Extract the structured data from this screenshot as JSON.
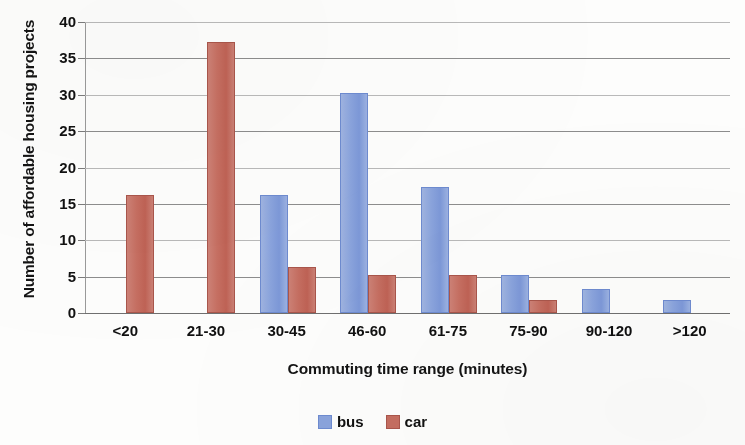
{
  "chart_data": {
    "type": "bar",
    "title": "",
    "xlabel": "Commuting time range (minutes)",
    "ylabel": "Number of affordable housing projects",
    "categories": [
      "<20",
      "21-30",
      "30-45",
      "46-60",
      "61-75",
      "75-90",
      "90-120",
      ">120"
    ],
    "series": [
      {
        "name": "bus",
        "color": "#8aa3dc",
        "values": [
          0,
          0,
          16,
          30,
          17,
          5,
          3,
          1.5
        ]
      },
      {
        "name": "car",
        "color": "#c56e61",
        "values": [
          16,
          37,
          6,
          5,
          5,
          1.5,
          0,
          0
        ]
      }
    ],
    "ylim": [
      0,
      40
    ],
    "ytick_step": 5,
    "yticks": [
      "40",
      "35",
      "30",
      "25",
      "20",
      "15",
      "10",
      "5",
      "0"
    ],
    "grid": true,
    "legend_position": "bottom"
  },
  "legend": {
    "items": [
      {
        "label": "bus",
        "swatch": "bus-color-swatch"
      },
      {
        "label": "car",
        "swatch": "car-color-swatch"
      }
    ]
  },
  "colors": {
    "bus": "#8aa3dc",
    "car": "#c56e61",
    "gridline": "#b9b9b9",
    "axis": "#7a7a7a",
    "text": "#111111",
    "background": "#fdfdfc"
  }
}
